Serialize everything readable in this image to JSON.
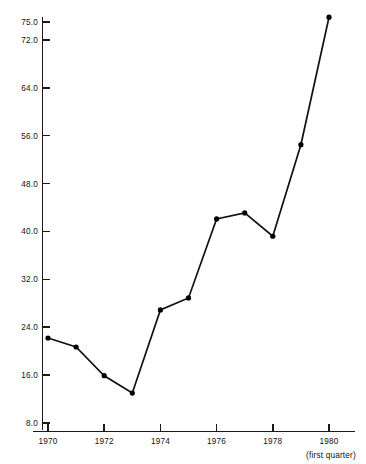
{
  "chart_data": {
    "type": "line",
    "title": "",
    "subtitle": "",
    "xlabel": "",
    "ylabel": "",
    "x": [
      1970,
      1971,
      1972,
      1973,
      1974,
      1975,
      1976,
      1977,
      1978,
      1979,
      1980
    ],
    "values": [
      22.2,
      20.7,
      15.9,
      13.0,
      26.9,
      28.9,
      42.1,
      43.1,
      39.2,
      54.5,
      75.8
    ],
    "series": [
      {
        "name": "series-1",
        "values": [
          22.2,
          20.7,
          15.9,
          13.0,
          26.9,
          28.9,
          42.1,
          43.1,
          39.2,
          54.5,
          75.8
        ]
      }
    ],
    "xlim": [
      1969.5,
      1980.6
    ],
    "ylim": [
      8.0,
      75.0
    ],
    "grid": false,
    "legend": false,
    "markers": "filled-circle",
    "y_tick_labels": [
      "8.0",
      "16.0",
      "24.0",
      "32.0",
      "40.0",
      "48.0",
      "56.0",
      "64.0",
      "72.0",
      "75.0"
    ],
    "y_tick_values": [
      8.0,
      16.0,
      24.0,
      32.0,
      40.0,
      48.0,
      56.0,
      64.0,
      72.0,
      75.0
    ],
    "x_tick_labels": [
      "1970",
      "1972",
      "1974",
      "1976",
      "1978",
      "1980"
    ],
    "x_tick_values": [
      1970,
      1972,
      1974,
      1976,
      1978,
      1980
    ],
    "x_minor_tick_values": [
      1971,
      1973,
      1975,
      1977,
      1979
    ],
    "annotations": [
      {
        "text": "(first quarter)",
        "anchor_x": 1980,
        "position": "below-last-xtick"
      }
    ],
    "colors": {
      "line": "#111111",
      "marker": "#000000",
      "axis": "#1a1a1a",
      "background": "#ffffff",
      "text": "#111111"
    }
  }
}
